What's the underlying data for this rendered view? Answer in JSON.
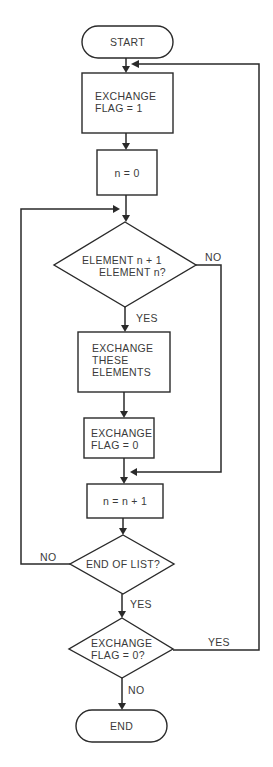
{
  "diagram": {
    "type": "flowchart",
    "colors": {
      "stroke": "#2a2a2a",
      "text": "#3a3a3a",
      "background": "#ffffff"
    },
    "nodes": {
      "start": {
        "shape": "terminator",
        "lines": [
          "START"
        ]
      },
      "set_flag_1": {
        "shape": "process",
        "lines": [
          "EXCHANGE",
          "FLAG = 1"
        ]
      },
      "set_n_0": {
        "shape": "process",
        "lines": [
          "n = 0"
        ]
      },
      "compare": {
        "shape": "decision",
        "lines": [
          "ELEMENT n + 1",
          "ELEMENT n?"
        ]
      },
      "swap": {
        "shape": "process",
        "lines": [
          "EXCHANGE",
          "THESE",
          "ELEMENTS"
        ]
      },
      "set_flag_0": {
        "shape": "process",
        "lines": [
          "EXCHANGE",
          "FLAG = 0"
        ]
      },
      "increment": {
        "shape": "process",
        "lines": [
          "n = n + 1"
        ]
      },
      "end_of_list": {
        "shape": "decision",
        "lines": [
          "END OF LIST?"
        ]
      },
      "flag_check": {
        "shape": "decision",
        "lines": [
          "EXCHANGE",
          "FLAG = 0?"
        ]
      },
      "end": {
        "shape": "terminator",
        "lines": [
          "END"
        ]
      }
    },
    "edge_labels": {
      "compare_no": "NO",
      "compare_yes": "YES",
      "end_of_list_no": "NO",
      "end_of_list_yes": "YES",
      "flag_check_yes": "YES",
      "flag_check_no": "NO"
    },
    "edges": [
      {
        "from": "start",
        "to": "set_flag_1"
      },
      {
        "from": "set_flag_1",
        "to": "set_n_0"
      },
      {
        "from": "set_n_0",
        "to": "compare"
      },
      {
        "from": "compare",
        "to": "swap",
        "label": "YES"
      },
      {
        "from": "compare",
        "to": "increment",
        "label": "NO"
      },
      {
        "from": "swap",
        "to": "set_flag_0"
      },
      {
        "from": "set_flag_0",
        "to": "increment"
      },
      {
        "from": "increment",
        "to": "end_of_list"
      },
      {
        "from": "end_of_list",
        "to": "compare",
        "label": "NO"
      },
      {
        "from": "end_of_list",
        "to": "flag_check",
        "label": "YES"
      },
      {
        "from": "flag_check",
        "to": "set_flag_1",
        "label": "YES"
      },
      {
        "from": "flag_check",
        "to": "end",
        "label": "NO"
      }
    ]
  }
}
